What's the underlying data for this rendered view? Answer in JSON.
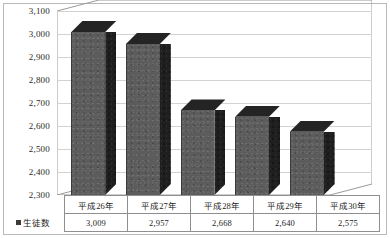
{
  "chart_data": {
    "type": "bar",
    "title": "",
    "xlabel": "",
    "ylabel": "",
    "categories": [
      "平成26年",
      "平成27年",
      "平成28年",
      "平成29年",
      "平成30年"
    ],
    "series": [
      {
        "name": "生徒数",
        "values": [
          3009,
          2957,
          2668,
          2640,
          2575
        ],
        "value_labels": [
          "3,009",
          "2,957",
          "2,668",
          "2,640",
          "2,575"
        ]
      }
    ],
    "ylim": [
      2300,
      3100
    ],
    "ytick_step": 100,
    "ytick_labels": [
      "3,100",
      "3,000",
      "2,900",
      "2,800",
      "2,700",
      "2,600",
      "2,500",
      "2,400",
      "2,300"
    ],
    "ytick_values": [
      3100,
      3000,
      2900,
      2800,
      2700,
      2600,
      2500,
      2400,
      2300
    ],
    "grid": true,
    "legend_position": "bottom-left",
    "three_d": true,
    "data_table_visible": true,
    "colors": {
      "bar_front": "#5c5c5c",
      "bar_side": "#1f1f1f",
      "bar_top": "#242424",
      "gridline": "#d2d2d2",
      "axis": "#9a9a9a",
      "border": "#b9b9b9",
      "text": "#1d1d1d"
    }
  }
}
